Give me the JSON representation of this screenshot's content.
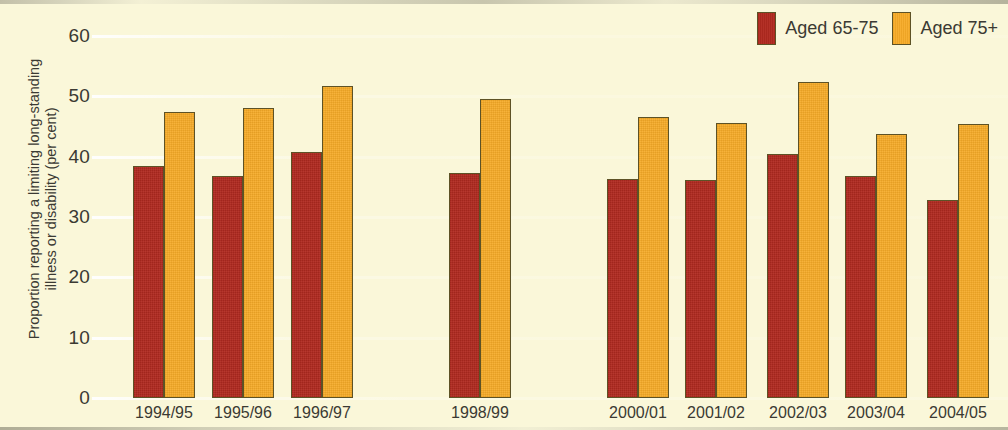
{
  "chart_data": {
    "type": "bar",
    "title": "",
    "subtitle": "",
    "xlabel": "",
    "ylabel": "Proportion reporting a limiting long-standing\nillness or disability (per cent)",
    "ylim": [
      0,
      60
    ],
    "yticks": [
      0,
      10,
      20,
      30,
      40,
      50,
      60
    ],
    "ytick_labels": [
      "0",
      "10",
      "20",
      "30",
      "40",
      "50",
      "60"
    ],
    "grid": true,
    "legend_position": "top-right",
    "categories": [
      "1994/95",
      "1995/96",
      "1996/97",
      "1998/99",
      "2000/01",
      "2001/02",
      "2002/03",
      "2003/04",
      "2004/05"
    ],
    "series": [
      {
        "name": "Aged 65-75",
        "color": "#b22a20",
        "values": [
          38.4,
          36.8,
          40.8,
          37.3,
          36.3,
          36.2,
          40.4,
          36.8,
          32.8
        ]
      },
      {
        "name": "Aged 75+",
        "color": "#f7ab27",
        "values": [
          47.4,
          48.0,
          51.7,
          49.6,
          46.6,
          45.5,
          52.3,
          43.8,
          45.4
        ]
      }
    ]
  },
  "legend": {
    "entries": [
      {
        "label": "Aged 65-75",
        "color": "#b22a20"
      },
      {
        "label": "Aged 75+",
        "color": "#f7ab27"
      }
    ]
  },
  "colors": {
    "background": "#faf7d9",
    "series_red": "#b22a20",
    "series_orange": "#f7ab27",
    "bar_outline": "#5d5226",
    "text": "#3b3a33",
    "gridline": "#ffffff"
  },
  "geometry": {
    "baseline_y": 398,
    "top_value_y": 36,
    "plot_left": 92,
    "plot_right": 1008,
    "bar_width": 31,
    "group_starts": [
      133,
      212,
      291,
      449,
      607,
      685,
      767,
      845,
      927
    ]
  }
}
